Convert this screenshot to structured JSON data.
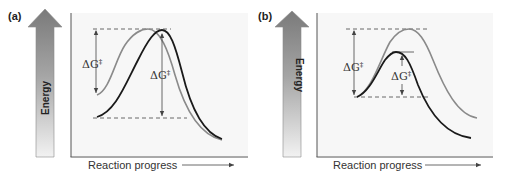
{
  "figure": {
    "panels": [
      {
        "id": "a",
        "label": "(a)",
        "y_axis_label": "Energy",
        "x_axis_label": "Reaction progress",
        "left_annotation": "ΔG",
        "right_annotation": "ΔG",
        "annotation_superscript": "‡",
        "description": "Same activation peak height; gray curve starts higher (smaller ΔG‡), black curve starts lower (larger ΔG‡)"
      },
      {
        "id": "b",
        "label": "(b)",
        "y_axis_label": "Energy",
        "x_axis_label": "Reaction progress",
        "left_annotation": "ΔG",
        "right_annotation": "ΔG",
        "annotation_superscript": "‡",
        "description": "Same starting energy; gray curve has higher peak (larger ΔG‡), black curve has lower peak (smaller ΔG‡)"
      }
    ],
    "colors": {
      "background": "#ffffff",
      "plot_background": "#f7f7f7",
      "gray_curve": "#8a8a8a",
      "black_curve": "#1a1a1a",
      "arrow_top": "#7a7a7a",
      "arrow_bottom": "#f2f2f2",
      "axis": "#555555",
      "dashed": "#444444"
    }
  }
}
